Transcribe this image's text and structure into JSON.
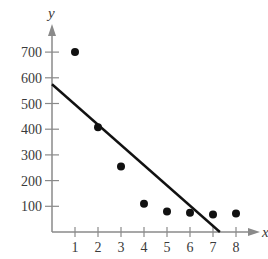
{
  "chart_data": {
    "type": "scatter",
    "title": "",
    "xlabel": "x",
    "ylabel": "y",
    "x": [
      1,
      2,
      3,
      4,
      5,
      6,
      7,
      8
    ],
    "values": [
      700,
      408,
      255,
      110,
      80,
      75,
      68,
      72
    ],
    "series": [
      {
        "name": "data points",
        "type": "scatter",
        "x": [
          1,
          2,
          3,
          4,
          5,
          6,
          7,
          8
        ],
        "values": [
          700,
          408,
          255,
          110,
          80,
          75,
          68,
          72
        ]
      },
      {
        "name": "linear fit",
        "type": "line",
        "x": [
          0,
          7.3
        ],
        "values": [
          575,
          0
        ]
      }
    ],
    "x_ticks": [
      "1",
      "2",
      "3",
      "4",
      "5",
      "6",
      "7",
      "8"
    ],
    "y_ticks": [
      "100",
      "200",
      "300",
      "400",
      "500",
      "600",
      "700"
    ],
    "xlim": [
      0,
      9
    ],
    "ylim": [
      0,
      780
    ],
    "grid": false,
    "legend": "none"
  },
  "colors": {
    "axis": "#8a8a8a",
    "points": "#111111",
    "line": "#111111",
    "text": "#3a3a3a"
  }
}
